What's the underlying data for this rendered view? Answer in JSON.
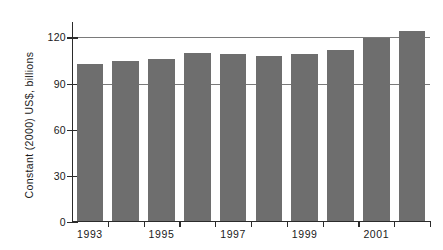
{
  "chart_data": {
    "type": "bar",
    "title": "",
    "subtitle": "",
    "xlabel": "",
    "ylabel": "Constant (2000) US$, billions",
    "categories": [
      "1993",
      "1994",
      "1995",
      "1996",
      "1997",
      "1998",
      "1999",
      "2000",
      "2001",
      "2002"
    ],
    "values": [
      102,
      104,
      105,
      109,
      108,
      107,
      108,
      111,
      119,
      123
    ],
    "xtick_labels": [
      "1993",
      "1995",
      "1997",
      "1999",
      "2001"
    ],
    "xtick_label_categories": [
      "1993",
      "1995",
      "1997",
      "1999",
      "2001"
    ],
    "ytick_labels": [
      "0",
      "30",
      "60",
      "90",
      "120"
    ],
    "ytick_values": [
      0,
      30,
      60,
      90,
      120
    ],
    "ylim": [
      0,
      130
    ],
    "gridlines": [
      90,
      120
    ],
    "grid": true,
    "legend": null,
    "legend_position": "none",
    "bar_color": "#6e6e6e",
    "axis_color": "#2b2b2b",
    "grid_color": "#7a7a7a",
    "background_color": "#ffffff"
  }
}
